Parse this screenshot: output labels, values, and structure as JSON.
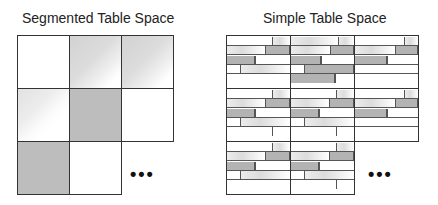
{
  "left": {
    "title": "Segmented Table Space",
    "grid": {
      "cols": 3,
      "rows": 3,
      "cell_w": 52,
      "cell_h": 53
    },
    "cells": [
      {
        "r": 0,
        "c": 0,
        "fill": "empty"
      },
      {
        "r": 0,
        "c": 1,
        "fill": "partial"
      },
      {
        "r": 0,
        "c": 2,
        "fill": "partial"
      },
      {
        "r": 1,
        "c": 0,
        "fill": "light"
      },
      {
        "r": 1,
        "c": 1,
        "fill": "full"
      },
      {
        "r": 1,
        "c": 2,
        "fill": "empty"
      },
      {
        "r": 2,
        "c": 0,
        "fill": "full"
      },
      {
        "r": 2,
        "c": 1,
        "fill": "empty"
      }
    ],
    "ellipsis": "•••"
  },
  "right": {
    "title": "Simple Table Space",
    "ellipsis": "•••",
    "cells": [
      {
        "r": 0,
        "c": 0
      },
      {
        "r": 0,
        "c": 1
      },
      {
        "r": 0,
        "c": 2
      },
      {
        "r": 1,
        "c": 0
      },
      {
        "r": 1,
        "c": 1
      },
      {
        "r": 1,
        "c": 2
      },
      {
        "r": 2,
        "c": 0
      },
      {
        "r": 2,
        "c": 1
      }
    ]
  },
  "colors": {
    "border": "#333333",
    "dark_fill": "#b3b3b3",
    "light_fill": "#e6e6e6"
  }
}
